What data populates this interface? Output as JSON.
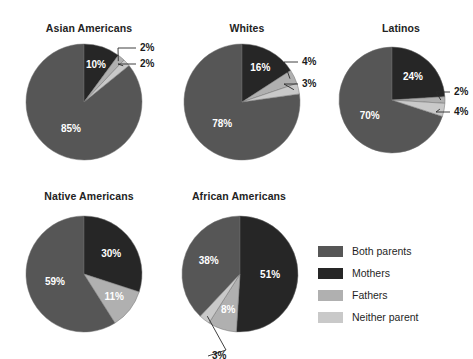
{
  "figure": {
    "background": "#ffffff"
  },
  "legend": {
    "name": "chart-legend",
    "items": [
      {
        "label": "Both parents",
        "color": "#565656"
      },
      {
        "label": "Mothers",
        "color": "#262626"
      },
      {
        "label": "Fathers",
        "color": "#b0b0b0"
      },
      {
        "label": "Neither parent",
        "color": "#c9c9c9"
      }
    ]
  },
  "chart_data": [
    {
      "type": "pie",
      "title": "Asian Americans",
      "categories": [
        "Both parents",
        "Mothers",
        "Fathers",
        "Neither parent"
      ],
      "values": [
        85,
        10,
        2,
        2
      ],
      "labels": [
        "85%",
        "10%",
        "2%",
        "2%"
      ],
      "colors": [
        "#565656",
        "#262626",
        "#b0b0b0",
        "#c9c9c9"
      ],
      "label_placement": [
        "inside",
        "inside",
        "callout",
        "callout"
      ]
    },
    {
      "type": "pie",
      "title": "Whites",
      "categories": [
        "Both parents",
        "Mothers",
        "Fathers",
        "Neither parent"
      ],
      "values": [
        78,
        16,
        4,
        3
      ],
      "labels": [
        "78%",
        "16%",
        "4%",
        "3%"
      ],
      "colors": [
        "#565656",
        "#262626",
        "#b0b0b0",
        "#c9c9c9"
      ],
      "label_placement": [
        "inside",
        "inside",
        "callout",
        "callout"
      ]
    },
    {
      "type": "pie",
      "title": "Latinos",
      "categories": [
        "Both parents",
        "Mothers",
        "Fathers",
        "Neither parent"
      ],
      "values": [
        70,
        24,
        2,
        4
      ],
      "labels": [
        "70%",
        "24%",
        "2%",
        "4%"
      ],
      "colors": [
        "#565656",
        "#262626",
        "#b0b0b0",
        "#c9c9c9"
      ],
      "label_placement": [
        "inside",
        "inside",
        "callout",
        "callout"
      ]
    },
    {
      "type": "pie",
      "title": "Native Americans",
      "categories": [
        "Both parents",
        "Mothers",
        "Fathers"
      ],
      "values": [
        59,
        30,
        11
      ],
      "labels": [
        "59%",
        "30%",
        "11%"
      ],
      "colors": [
        "#565656",
        "#262626",
        "#b0b0b0"
      ],
      "label_placement": [
        "inside",
        "inside",
        "inside"
      ]
    },
    {
      "type": "pie",
      "title": "African Americans",
      "categories": [
        "Both parents",
        "Mothers",
        "Fathers",
        "Neither parent"
      ],
      "values": [
        38,
        51,
        8,
        3
      ],
      "labels": [
        "38%",
        "51%",
        "8%",
        "3%"
      ],
      "colors": [
        "#565656",
        "#262626",
        "#b0b0b0",
        "#c9c9c9"
      ],
      "label_placement": [
        "inside",
        "inside",
        "inside",
        "callout"
      ]
    }
  ],
  "layout": {
    "charts": [
      {
        "left": 14,
        "top": 22,
        "radius": 58,
        "cx": 70,
        "cy": 62,
        "callouts": [
          {
            "index": 2,
            "text_x": 126,
            "text_y": 8,
            "elbow_x": 104,
            "elbow_y": 8,
            "anchor_x": 78,
            "anchor_y": 20
          },
          {
            "index": 3,
            "text_x": 126,
            "text_y": 24,
            "elbow_x": 104,
            "elbow_y": 24,
            "anchor_x": 86,
            "anchor_y": 32
          }
        ]
      },
      {
        "left": 172,
        "top": 22,
        "radius": 58,
        "cx": 70,
        "cy": 62,
        "callouts": [
          {
            "index": 2,
            "text_x": 130,
            "text_y": 22,
            "elbow_x": 112,
            "elbow_y": 22,
            "anchor_x": 94,
            "anchor_y": 34
          },
          {
            "index": 3,
            "text_x": 130,
            "text_y": 44,
            "elbow_x": 112,
            "elbow_y": 44,
            "anchor_x": 98,
            "anchor_y": 50
          }
        ]
      },
      {
        "left": 326,
        "top": 22,
        "radius": 53,
        "cx": 66,
        "cy": 60,
        "callouts": [
          {
            "index": 2,
            "text_x": 128,
            "text_y": 52,
            "elbow_x": 110,
            "elbow_y": 52,
            "anchor_x": 96,
            "anchor_y": 56
          },
          {
            "index": 3,
            "text_x": 128,
            "text_y": 72,
            "elbow_x": 110,
            "elbow_y": 72,
            "anchor_x": 96,
            "anchor_y": 70
          }
        ]
      },
      {
        "left": 14,
        "top": 190,
        "radius": 58,
        "cx": 70,
        "cy": 66,
        "callouts": []
      },
      {
        "left": 164,
        "top": 190,
        "radius": 58,
        "cx": 76,
        "cy": 66,
        "callouts": [
          {
            "index": 3,
            "text_x": 48,
            "text_y": 148,
            "elbow_x": 62,
            "elbow_y": 142,
            "anchor_x": 68,
            "anchor_y": 124
          }
        ]
      }
    ]
  }
}
